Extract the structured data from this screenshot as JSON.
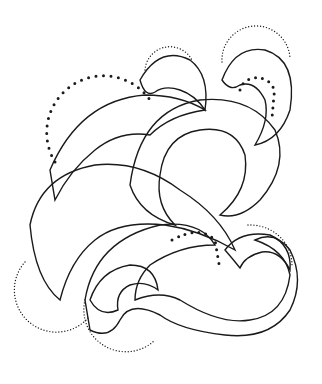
{
  "image": {
    "description": "Black-and-white engraved illustration of intertwining swirling ribbons with fine hatching lines, accented by dotted circular guide arcs",
    "background_color": "#ffffff",
    "ink_color": "#1a1a1a",
    "elements": [
      {
        "type": "dotted-circle",
        "name": "large-dotted-arc-left",
        "cx": 85,
        "cy": 115,
        "r": 55,
        "dot": "large"
      },
      {
        "type": "dotted-circle",
        "name": "small-dotted-arc-top-center",
        "cx": 168,
        "cy": 65,
        "r": 25,
        "dot": "small"
      },
      {
        "type": "dotted-circle",
        "name": "small-dotted-arc-top-right",
        "cx": 250,
        "cy": 70,
        "r": 30,
        "dot": "small"
      },
      {
        "type": "dotted-arc",
        "name": "inner-dotted-arc-top-right",
        "cx": 255,
        "cy": 90,
        "r": 12,
        "dot": "large"
      },
      {
        "type": "dotted-circle",
        "name": "dotted-arc-bottom-left",
        "cx": 60,
        "cy": 265,
        "r": 42,
        "dot": "small"
      },
      {
        "type": "dotted-circle",
        "name": "dotted-arc-bottom-center",
        "cx": 120,
        "cy": 320,
        "r": 40,
        "dot": "small"
      },
      {
        "type": "dotted-arc",
        "name": "dotted-arc-center-right",
        "cx": 220,
        "cy": 255,
        "r": 35,
        "dot": "large"
      },
      {
        "type": "dotted-circle",
        "name": "dotted-arc-right",
        "cx": 265,
        "cy": 275,
        "r": 42,
        "dot": "small"
      }
    ]
  }
}
